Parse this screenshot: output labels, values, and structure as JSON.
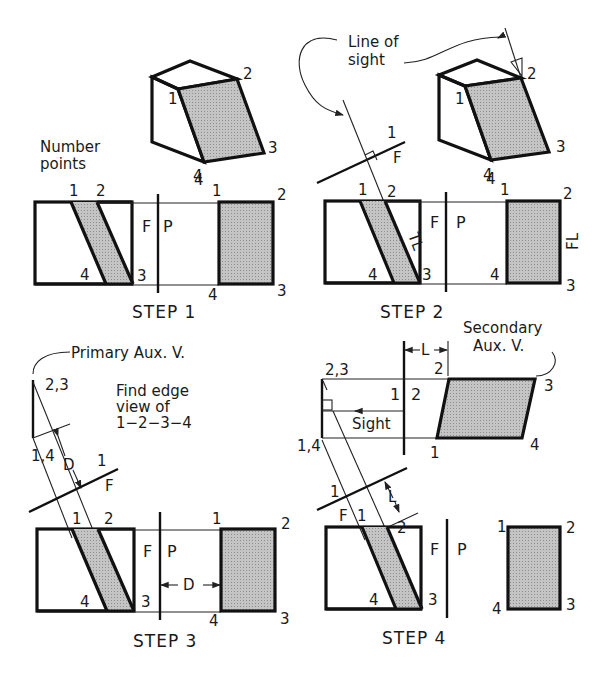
{
  "figure": {
    "accent_colors": {
      "line": "#111111",
      "shade": "#b9b9b9",
      "background": "#ffffff"
    }
  },
  "step1": {
    "caption": "STEP 1",
    "note_line1": "Number",
    "note_line2": "points",
    "iso_labels": {
      "p1": "1",
      "p2": "2",
      "p3": "3",
      "p4": "4"
    },
    "front_labels": {
      "p1": "1",
      "p2": "2",
      "p3": "3",
      "p4": "4"
    },
    "fold_left": "F",
    "fold_right": "P",
    "profile_labels": {
      "p1": "1",
      "p2": "2",
      "p3": "3",
      "p4_top": "4",
      "p4_bottom": "4"
    }
  },
  "step2": {
    "caption": "STEP 2",
    "callout_line1": "Line of",
    "callout_line2": "sight",
    "iso_labels": {
      "p1": "1",
      "p2": "2",
      "p3": "3",
      "p4": "4"
    },
    "fold_line_labels": {
      "upper": "1",
      "lower": "F"
    },
    "front_labels": {
      "p1": "1",
      "p2": "2",
      "p3": "3",
      "p4": "4"
    },
    "true_length": "TL",
    "fold_left": "F",
    "fold_right": "P",
    "profile_labels": {
      "p1": "1",
      "p2": "2",
      "p3": "3",
      "p4_top": "4",
      "p4_bottom": "4"
    },
    "frontal_length": "FL"
  },
  "step3": {
    "caption": "STEP 3",
    "callout": "Primary Aux. V.",
    "note_line1": "Find edge",
    "note_line2": "view of",
    "note_line3": "1−2−3−4",
    "aux_labels": {
      "top": "2,3",
      "bottom": "1,4"
    },
    "dim_aux": "D",
    "fold_line_labels": {
      "upper": "1",
      "lower": "F"
    },
    "front_labels": {
      "p1": "1",
      "p2": "2",
      "p3": "3",
      "p4": "4"
    },
    "fold_left": "F",
    "fold_right": "P",
    "dim_profile": "D",
    "profile_labels": {
      "p1": "1",
      "p2": "2",
      "p3": "3",
      "p4": "4"
    }
  },
  "step4": {
    "caption": "STEP 4",
    "callout_line1": "Secondary",
    "callout_line2": "Aux. V.",
    "dim_secondary": "L",
    "aux_labels": {
      "top": "2,3",
      "bottom": "1,4"
    },
    "fold_12_left": "1",
    "fold_12_right": "2",
    "sight": "Sight",
    "secondary_labels": {
      "p1": "1",
      "p2": "2",
      "p3": "3",
      "p4": "4"
    },
    "fold_line_labels": {
      "upper": "1",
      "lower": "F",
      "mid": "1"
    },
    "dim_primary": "L",
    "front_labels": {
      "p2": "2",
      "p3": "3",
      "p4": "4"
    },
    "fold_left": "F",
    "fold_right": "P",
    "profile_labels": {
      "p1": "1",
      "p2": "2",
      "p3": "3",
      "p4": "4"
    }
  }
}
